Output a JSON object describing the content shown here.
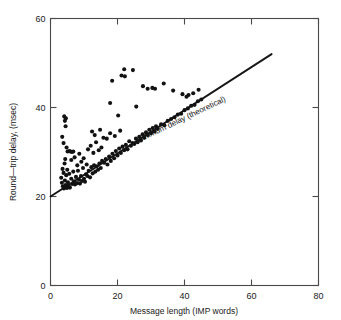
{
  "figure": {
    "background": "#ffffff",
    "point_color": "#121212",
    "line_color": "#161616",
    "axis_color": "#4a4a4a"
  },
  "chart_data": {
    "type": "scatter",
    "title": "",
    "xlabel": "Message length (IMP words)",
    "ylabel": "Round—trip delay, (msec)",
    "xlim": [
      0,
      80
    ],
    "ylim": [
      0,
      60
    ],
    "xticks": [
      0,
      20,
      40,
      60,
      80
    ],
    "yticks": [
      0,
      20,
      40,
      60
    ],
    "xtick_labels": [
      "0",
      "20",
      "40",
      "60",
      "80"
    ],
    "ytick_labels": [
      "0",
      "20",
      "40",
      "60"
    ],
    "grid": false,
    "legend": "none",
    "annotations": [
      {
        "text": "Minimum delay (theoretical)",
        "x": 26,
        "y": 32,
        "rotation": -25.5
      }
    ],
    "series": [
      {
        "name": "Minimum delay (theoretical)",
        "type": "line",
        "x": [
          0,
          66
        ],
        "y": [
          20,
          52
        ]
      },
      {
        "name": "Measured round-trip delay",
        "type": "scatter",
        "marker": "circle",
        "points": [
          [
            3.2,
            24.2
          ],
          [
            3.4,
            23.1
          ],
          [
            3.6,
            26.2
          ],
          [
            3.7,
            22.3
          ],
          [
            3.9,
            25.3
          ],
          [
            4.0,
            21.8
          ],
          [
            4.2,
            27.4
          ],
          [
            4.3,
            23.6
          ],
          [
            4.5,
            22.6
          ],
          [
            4.7,
            24.8
          ],
          [
            4.9,
            21.9
          ],
          [
            5.0,
            26.0
          ],
          [
            5.2,
            23.2
          ],
          [
            5.4,
            22.4
          ],
          [
            5.6,
            25.1
          ],
          [
            5.8,
            22.0
          ],
          [
            4.1,
            38.0
          ],
          [
            4.3,
            37.0
          ],
          [
            4.5,
            35.8
          ],
          [
            4.6,
            37.6
          ],
          [
            3.5,
            33.4
          ],
          [
            3.9,
            32.0
          ],
          [
            4.8,
            31.0
          ],
          [
            5.1,
            30.1
          ],
          [
            5.6,
            30.2
          ],
          [
            6.0,
            30.1
          ],
          [
            6.4,
            30.0
          ],
          [
            6.8,
            30.1
          ],
          [
            4.4,
            28.4
          ],
          [
            6.2,
            28.2
          ],
          [
            6.2,
            24.0
          ],
          [
            6.5,
            22.8
          ],
          [
            6.8,
            25.6
          ],
          [
            7.0,
            23.4
          ],
          [
            7.3,
            22.7
          ],
          [
            7.6,
            24.4
          ],
          [
            7.9,
            23.0
          ],
          [
            8.2,
            25.8
          ],
          [
            8.5,
            23.8
          ],
          [
            8.8,
            22.9
          ],
          [
            9.1,
            24.6
          ],
          [
            9.4,
            23.5
          ],
          [
            9.7,
            26.4
          ],
          [
            10.0,
            24.0
          ],
          [
            10.3,
            23.3
          ],
          [
            10.6,
            25.0
          ],
          [
            7.2,
            28.8
          ],
          [
            8.0,
            27.0
          ],
          [
            8.6,
            29.6
          ],
          [
            9.2,
            27.8
          ],
          [
            9.9,
            28.6
          ],
          [
            10.8,
            27.2
          ],
          [
            11.0,
            24.6
          ],
          [
            11.4,
            25.8
          ],
          [
            11.8,
            24.3
          ],
          [
            12.2,
            26.6
          ],
          [
            12.6,
            25.2
          ],
          [
            13.0,
            27.0
          ],
          [
            13.4,
            25.6
          ],
          [
            13.8,
            26.8
          ],
          [
            14.2,
            26.0
          ],
          [
            14.6,
            27.4
          ],
          [
            15.0,
            26.4
          ],
          [
            15.4,
            28.0
          ],
          [
            11.2,
            30.6
          ],
          [
            12.0,
            31.4
          ],
          [
            12.8,
            29.8
          ],
          [
            13.6,
            32.2
          ],
          [
            14.4,
            30.4
          ],
          [
            15.2,
            31.0
          ],
          [
            12.4,
            34.6
          ],
          [
            13.2,
            33.8
          ],
          [
            14.8,
            35.0
          ],
          [
            15.8,
            33.2
          ],
          [
            16.0,
            27.6
          ],
          [
            16.5,
            28.4
          ],
          [
            17.0,
            27.2
          ],
          [
            17.5,
            29.0
          ],
          [
            18.0,
            28.0
          ],
          [
            18.5,
            29.6
          ],
          [
            19.0,
            28.6
          ],
          [
            19.5,
            30.2
          ],
          [
            20.0,
            29.2
          ],
          [
            20.5,
            30.8
          ],
          [
            21.0,
            29.8
          ],
          [
            21.5,
            31.2
          ],
          [
            16.8,
            33.0
          ],
          [
            17.8,
            34.2
          ],
          [
            19.2,
            33.6
          ],
          [
            20.8,
            34.8
          ],
          [
            22.0,
            30.4
          ],
          [
            22.5,
            31.6
          ],
          [
            23.0,
            30.6
          ],
          [
            23.5,
            32.4
          ],
          [
            24.0,
            31.4
          ],
          [
            24.5,
            32.0
          ],
          [
            25.0,
            31.8
          ],
          [
            25.5,
            33.0
          ],
          [
            26.0,
            32.2
          ],
          [
            26.5,
            33.4
          ],
          [
            27.0,
            32.6
          ],
          [
            27.5,
            34.0
          ],
          [
            28.0,
            33.2
          ],
          [
            28.5,
            34.4
          ],
          [
            29.0,
            33.8
          ],
          [
            29.5,
            35.0
          ],
          [
            30.0,
            34.2
          ],
          [
            30.5,
            35.4
          ],
          [
            31.0,
            34.6
          ],
          [
            31.5,
            35.8
          ],
          [
            32.0,
            35.2
          ],
          [
            33.0,
            36.2
          ],
          [
            34.0,
            36.0
          ],
          [
            35.0,
            37.0
          ],
          [
            36.0,
            37.4
          ],
          [
            37.0,
            37.8
          ],
          [
            38.0,
            38.4
          ],
          [
            39.0,
            38.6
          ],
          [
            40.0,
            39.4
          ],
          [
            41.0,
            39.8
          ],
          [
            42.0,
            40.4
          ],
          [
            43.0,
            40.6
          ],
          [
            44.0,
            41.4
          ],
          [
            45.0,
            41.8
          ],
          [
            21.2,
            47.2
          ],
          [
            22.0,
            48.6
          ],
          [
            22.2,
            47.0
          ],
          [
            24.6,
            48.4
          ],
          [
            18.4,
            46.0
          ],
          [
            27.6,
            44.8
          ],
          [
            29.0,
            44.2
          ],
          [
            30.4,
            44.4
          ],
          [
            31.2,
            44.2
          ],
          [
            33.8,
            45.4
          ],
          [
            36.6,
            43.8
          ],
          [
            39.4,
            43.0
          ],
          [
            40.6,
            42.4
          ],
          [
            41.2,
            42.8
          ],
          [
            42.6,
            43.2
          ],
          [
            44.2,
            44.0
          ],
          [
            25.6,
            40.2
          ],
          [
            17.8,
            41.0
          ],
          [
            20.2,
            38.2
          ]
        ]
      }
    ]
  }
}
